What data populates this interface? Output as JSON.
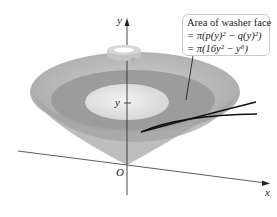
{
  "diagram": {
    "callout": {
      "line1": "Area of washer face",
      "line2": "= π(p(y)² − q(y)²)",
      "line3": "= π(16y² − y⁶)"
    },
    "axes": {
      "y_label": "y",
      "x_label": "x",
      "origin_label": "O",
      "y_tick_label": "y"
    },
    "icons": [
      "rotation-arrow-icon"
    ],
    "colors": {
      "outer_surface": "#b9b9b9",
      "middle_ring": "#9a9a9a",
      "inner_face": "#e2e2e2",
      "axis": "#333333",
      "curve": "#111111"
    }
  }
}
